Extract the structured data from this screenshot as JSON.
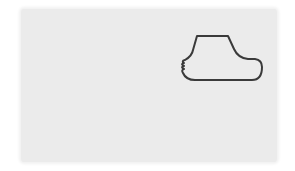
{
  "figure": {
    "background_color": "#ffffff",
    "panel_color": "#ebebeb",
    "stroke_color": "#3a3a3a",
    "shape": {
      "description": "foot-like outline with wavy toes on the left",
      "icon": "foot-outline-icon"
    }
  }
}
